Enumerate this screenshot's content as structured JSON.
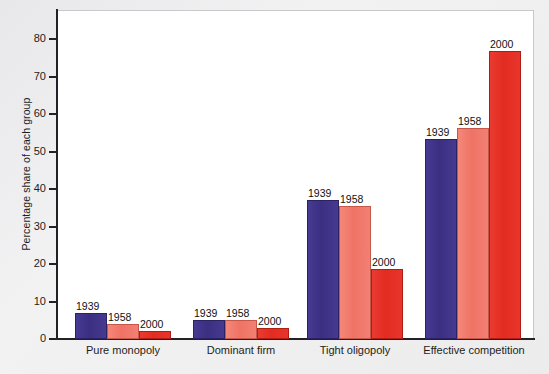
{
  "chart_data": {
    "type": "bar",
    "title": "",
    "xlabel": "",
    "ylabel": "Percentage share of each group",
    "ylim": [
      0,
      85
    ],
    "yticks": [
      0,
      10,
      20,
      30,
      40,
      50,
      60,
      70,
      80
    ],
    "grid": false,
    "legend_position": "none",
    "categories": [
      "Pure monopoly",
      "Dominant firm",
      "Tight oligopoly",
      "Effective competition"
    ],
    "series": [
      {
        "name": "1939",
        "color": "#3a2f80",
        "values": [
          6.9,
          5.0,
          36.8,
          52.8
        ]
      },
      {
        "name": "1958",
        "color": "#ef7365",
        "values": [
          4.0,
          5.0,
          35.2,
          55.9
        ]
      },
      {
        "name": "2000",
        "color": "#e22c22",
        "values": [
          2.2,
          2.8,
          18.5,
          76.3
        ]
      }
    ],
    "bar_labels": [
      [
        "1939",
        "1958",
        "2000"
      ],
      [
        "1939",
        "1958",
        "2000"
      ],
      [
        "1939",
        "1958",
        "2000"
      ],
      [
        "1939",
        "1958",
        "2000"
      ]
    ]
  },
  "axis": {
    "y_title": "Percentage share of each group",
    "y_tick_labels": [
      "80",
      "70",
      "60",
      "50",
      "40",
      "30",
      "20",
      "10",
      "0"
    ],
    "x_tick_labels": [
      "Pure monopoly",
      "Dominant firm",
      "Tight oligopoly",
      "Effective competition"
    ]
  },
  "colors": {
    "series_1939": "#3a2f80",
    "series_1958": "#ef7365",
    "series_2000": "#e22c22",
    "axis": "#222226",
    "plot_background": "#ffffff",
    "page_background": "#ecedee"
  }
}
